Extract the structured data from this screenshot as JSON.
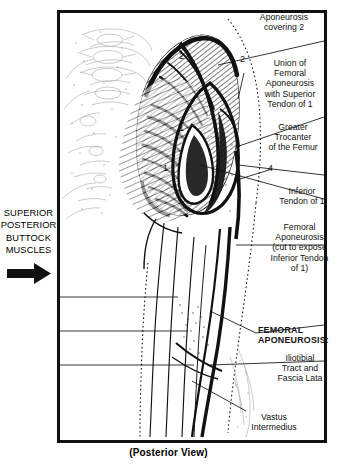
{
  "figure": {
    "caption": "(Posterior View)",
    "left_block": {
      "lines": [
        "SUPERIOR",
        "POSTERIOR",
        "BUTTOCK",
        "MUSCLES"
      ],
      "arrow_icon": "arrow-right-icon"
    },
    "left_labels": [
      {
        "id": "vastus-lateralis",
        "lines": [
          "Vastus",
          "Lateralis"
        ]
      },
      {
        "id": "semitendinosus",
        "lines": [
          "Semi-",
          "tendinosus"
        ]
      },
      {
        "id": "biceps-femoris",
        "lines": [
          "Biceps",
          "Femoris"
        ]
      }
    ],
    "right_labels": [
      {
        "id": "aponeurosis-covering-2",
        "lines": [
          "Aponeurosis",
          "covering 2"
        ],
        "bold": false
      },
      {
        "id": "union-femoral-aponeurosis",
        "lines": [
          "Union of",
          "Femoral",
          "Aponeurosis",
          "with Superior",
          "Tendon of 1"
        ],
        "bold": false
      },
      {
        "id": "greater-trochanter",
        "lines": [
          "Greater",
          "Trocanter",
          "of the Femur"
        ],
        "bold": false
      },
      {
        "id": "inferior-tendon-of-1",
        "lines": [
          "Inferior",
          "Tendon of 1"
        ],
        "bold": false
      },
      {
        "id": "femoral-aponeurosis-cut",
        "lines": [
          "Femoral",
          "Aponeurosis",
          "(cut to expose",
          "Inferior Tendon",
          "of 1)"
        ],
        "bold": false
      },
      {
        "id": "femoral-aponeurosis-heading",
        "lines": [
          "FEMORAL",
          "APONEUROSIS:"
        ],
        "bold": true
      },
      {
        "id": "iliotibial-tract",
        "lines": [
          "Iliotibial",
          "Tract and",
          "Fascia Lata"
        ],
        "bold": false
      },
      {
        "id": "vastus-intermedius",
        "lines": [
          "Vastus",
          "Intermedius"
        ],
        "bold": false
      }
    ],
    "numerals": [
      {
        "id": "numeral-2-upper",
        "value": "2"
      },
      {
        "id": "numeral-2-right",
        "value": "2"
      },
      {
        "id": "numeral-1-upper",
        "value": "1"
      },
      {
        "id": "numeral-1-lower",
        "value": "1"
      },
      {
        "id": "numeral-4",
        "value": "4"
      }
    ],
    "colors": {
      "ink": "#111111",
      "paper": "#ffffff"
    }
  }
}
